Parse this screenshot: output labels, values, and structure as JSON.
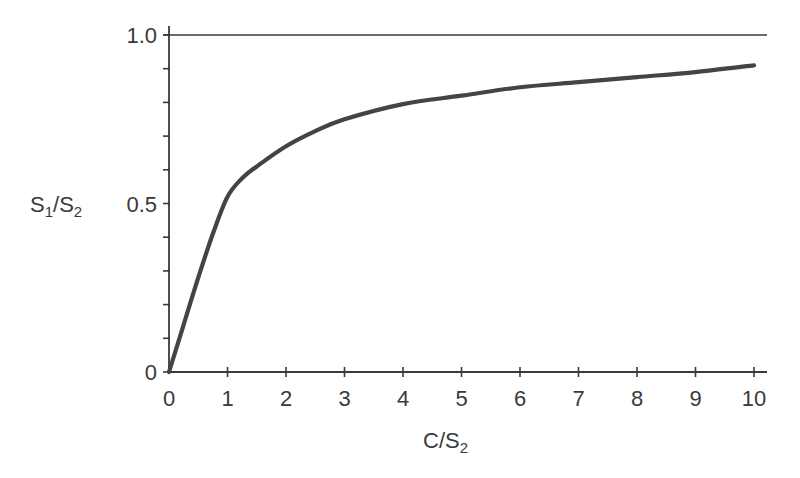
{
  "chart_data": {
    "type": "line",
    "title": "",
    "xlabel": "C/S2",
    "ylabel": "S1/S2",
    "xlabel_parts": {
      "main": "C/S",
      "sub": "2"
    },
    "ylabel_parts": {
      "a": "S",
      "a_sub": "1",
      "mid": "/S",
      "b_sub": "2"
    },
    "xlim": [
      0,
      10
    ],
    "ylim": [
      0,
      1.0
    ],
    "x_ticks": [
      0,
      1,
      2,
      3,
      4,
      5,
      6,
      7,
      8,
      9,
      10
    ],
    "x_tick_labels": [
      "0",
      "1",
      "2",
      "3",
      "4",
      "5",
      "6",
      "7",
      "8",
      "9",
      "10"
    ],
    "y_ticks_minor": [
      0,
      0.1,
      0.2,
      0.3,
      0.4,
      0.5,
      0.6,
      0.7,
      0.8,
      0.9,
      1.0
    ],
    "y_tick_labels": [
      {
        "value": 0,
        "label": "0"
      },
      {
        "value": 0.5,
        "label": "0.5"
      },
      {
        "value": 1.0,
        "label": "1.0"
      }
    ],
    "grid": false,
    "reference_lines": [
      {
        "y": 1.0,
        "label": "asymptote"
      }
    ],
    "series": [
      {
        "name": "S1/S2 vs C/S2",
        "color": "#444444",
        "x": [
          0,
          0.25,
          0.5,
          0.75,
          1.0,
          1.25,
          1.5,
          2.0,
          2.5,
          3.0,
          4.0,
          5.0,
          6.0,
          7.0,
          8.0,
          9.0,
          10.0
        ],
        "y": [
          0,
          0.14,
          0.28,
          0.41,
          0.52,
          0.575,
          0.61,
          0.67,
          0.715,
          0.75,
          0.795,
          0.82,
          0.845,
          0.86,
          0.875,
          0.89,
          0.91
        ]
      }
    ]
  },
  "colors": {
    "axis": "#3a3a3a",
    "curve": "#444444",
    "background": "#ffffff"
  }
}
